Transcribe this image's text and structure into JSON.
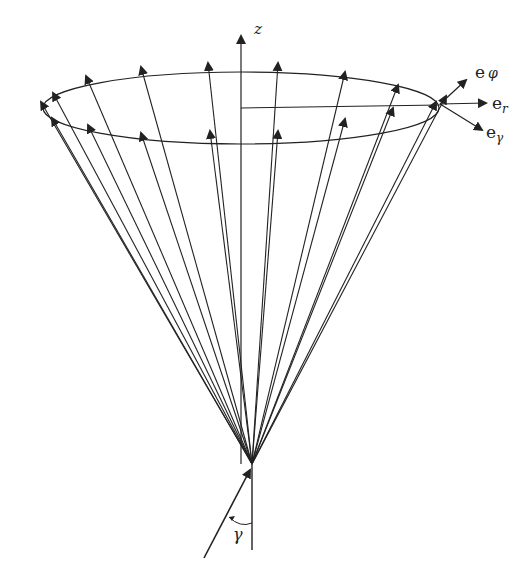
{
  "diagram": {
    "type": "cone-of-vectors",
    "labels": {
      "z_axis": "z",
      "e_phi_base": "e",
      "e_phi_sub": "φ",
      "e_r_base": "e",
      "e_r_sub": "r",
      "e_gamma_base": "e",
      "e_gamma_sub": "γ",
      "angle": "γ"
    },
    "colors": {
      "stroke": "#222222",
      "background": "#ffffff"
    },
    "apex": [
      252,
      464
    ],
    "ellipse": {
      "cx": 241,
      "cy": 108,
      "rx": 198,
      "ry": 36
    },
    "back_tips": [
      [
        41,
        102
      ],
      [
        53,
        93
      ],
      [
        86,
        76
      ],
      [
        141,
        67
      ],
      [
        208,
        63
      ],
      [
        278,
        63
      ],
      [
        345,
        72
      ],
      [
        398,
        85
      ],
      [
        445,
        96
      ]
    ],
    "front_tips": [
      [
        52,
        118
      ],
      [
        88,
        125
      ],
      [
        141,
        133
      ],
      [
        210,
        131
      ],
      [
        278,
        131
      ],
      [
        345,
        119
      ],
      [
        393,
        108
      ],
      [
        436,
        102
      ]
    ]
  }
}
